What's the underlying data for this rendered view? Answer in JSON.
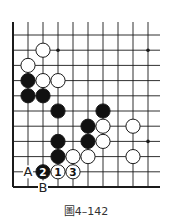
{
  "diagram": {
    "type": "go-board-fragment",
    "grid": {
      "columns": 10,
      "rows": 11,
      "origin_x": 13,
      "origin_y": 35,
      "spacing_x": 15,
      "spacing_y": 15.2,
      "top_line_start_y": 22,
      "right_extent_x": 160,
      "left_edge": "border",
      "bottom_edge": "border",
      "top_edge": "open",
      "right_edge": "open"
    },
    "star_points": [
      {
        "col": 3,
        "row": 1
      },
      {
        "col": 9,
        "row": 1
      },
      {
        "col": 9,
        "row": 7
      }
    ],
    "stones": [
      {
        "color": "white",
        "col": 2,
        "row": 1
      },
      {
        "color": "white",
        "col": 1,
        "row": 2
      },
      {
        "color": "black",
        "col": 1,
        "row": 3
      },
      {
        "color": "white",
        "col": 2,
        "row": 3
      },
      {
        "color": "white",
        "col": 3,
        "row": 3
      },
      {
        "color": "black",
        "col": 1,
        "row": 4
      },
      {
        "color": "black",
        "col": 2,
        "row": 4
      },
      {
        "color": "black",
        "col": 3,
        "row": 5
      },
      {
        "color": "black",
        "col": 6,
        "row": 5
      },
      {
        "color": "black",
        "col": 5,
        "row": 6
      },
      {
        "color": "white",
        "col": 6,
        "row": 6
      },
      {
        "color": "white",
        "col": 8,
        "row": 6
      },
      {
        "color": "black",
        "col": 3,
        "row": 7
      },
      {
        "color": "black",
        "col": 5,
        "row": 7
      },
      {
        "color": "white",
        "col": 6,
        "row": 7
      },
      {
        "color": "black",
        "col": 3,
        "row": 8
      },
      {
        "color": "white",
        "col": 4,
        "row": 8
      },
      {
        "color": "white",
        "col": 5,
        "row": 8
      },
      {
        "color": "white",
        "col": 8,
        "row": 8
      },
      {
        "color": "black",
        "col": 2,
        "row": 9,
        "label": "2"
      },
      {
        "color": "white",
        "col": 3,
        "row": 9,
        "label": "1"
      },
      {
        "color": "white",
        "col": 4,
        "row": 9,
        "label": "3"
      }
    ],
    "point_labels": [
      {
        "text": "A",
        "col": 1,
        "row": 9
      },
      {
        "text": "B",
        "col": 2,
        "row": 10
      }
    ],
    "colors": {
      "line": "#1a1a1a",
      "black_stone": "#111111",
      "white_stone": "#ffffff",
      "stone_outline": "#1a1a1a"
    }
  },
  "caption": "圖4–142"
}
